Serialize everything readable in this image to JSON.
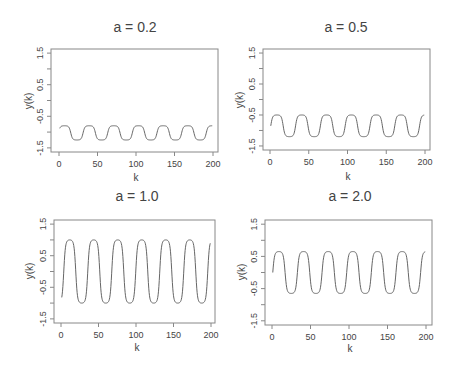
{
  "chart_data": [
    {
      "type": "line",
      "title": "a = 0.2",
      "xlabel": "k",
      "ylabel": "y(k)",
      "xlim": [
        0,
        200
      ],
      "ylim": [
        -1.5,
        1.5
      ],
      "xticks": [
        0,
        50,
        100,
        150,
        200
      ],
      "yticks": [
        -1.5,
        -0.5,
        0.5,
        1.5
      ],
      "grid": false,
      "series": [
        {
          "name": "y(k)",
          "period": 32,
          "max": -0.8,
          "min": -1.25,
          "start": -0.95
        }
      ]
    },
    {
      "type": "line",
      "title": "a = 0.5",
      "xlabel": "k",
      "ylabel": "y(k)",
      "xlim": [
        0,
        200
      ],
      "ylim": [
        -1.5,
        1.5
      ],
      "xticks": [
        0,
        50,
        100,
        150,
        200
      ],
      "yticks": [
        -1.5,
        -0.5,
        0.5,
        1.5
      ],
      "grid": false,
      "series": [
        {
          "name": "y(k)",
          "period": 32,
          "max": -0.5,
          "min": -1.2,
          "start": -0.85
        }
      ]
    },
    {
      "type": "line",
      "title": "a = 1.0",
      "xlabel": "k",
      "ylabel": "y(k)",
      "xlim": [
        0,
        200
      ],
      "ylim": [
        -1.5,
        1.5
      ],
      "xticks": [
        0,
        50,
        100,
        150,
        200
      ],
      "yticks": [
        -1.5,
        -0.5,
        0.5,
        1.5
      ],
      "grid": false,
      "series": [
        {
          "name": "y(k)",
          "period": 32,
          "max": 1.0,
          "min": -1.0,
          "start": -0.5
        }
      ]
    },
    {
      "type": "line",
      "title": "a = 2.0",
      "xlabel": "k",
      "ylabel": "y(k)",
      "xlim": [
        0,
        200
      ],
      "ylim": [
        -1.5,
        1.5
      ],
      "xticks": [
        0,
        50,
        100,
        150,
        200
      ],
      "yticks": [
        -1.5,
        -0.5,
        0.5,
        1.5
      ],
      "grid": false,
      "series": [
        {
          "name": "y(k)",
          "period": 32,
          "max": 0.65,
          "min": -0.65,
          "start": 0.0
        }
      ]
    }
  ],
  "panels": [
    {
      "title": "a = 0.2",
      "xlabel": "k",
      "ylabel": "y(k)"
    },
    {
      "title": "a = 0.5",
      "xlabel": "k",
      "ylabel": "y(k)"
    },
    {
      "title": "a = 1.0",
      "xlabel": "k",
      "ylabel": "y(k)"
    },
    {
      "title": "a = 2.0",
      "xlabel": "k",
      "ylabel": "y(k)"
    }
  ],
  "colors": {
    "line": "#666666",
    "axis": "#888888",
    "text": "#444444"
  }
}
